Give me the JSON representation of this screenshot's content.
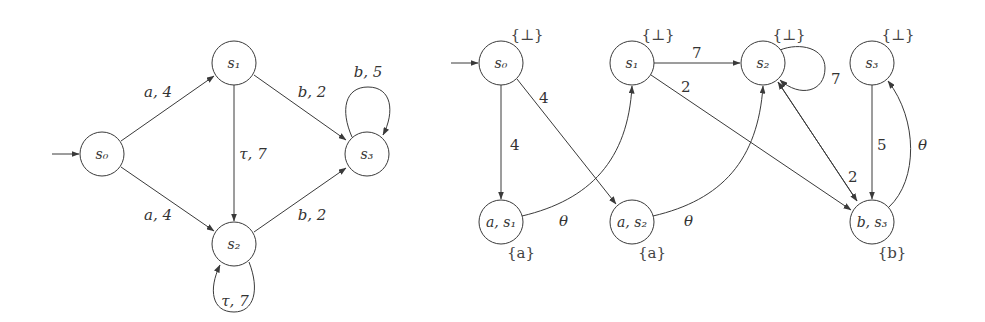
{
  "left_graph": {
    "initial_state": "s0",
    "nodes": [
      {
        "id": "s0",
        "label": "s₀"
      },
      {
        "id": "s1",
        "label": "s₁"
      },
      {
        "id": "s2",
        "label": "s₂"
      },
      {
        "id": "s3",
        "label": "s₃"
      }
    ],
    "edges": [
      {
        "from": "s0",
        "to": "s1",
        "label": "a, 4"
      },
      {
        "from": "s0",
        "to": "s2",
        "label": "a, 4"
      },
      {
        "from": "s1",
        "to": "s2",
        "label": "τ, 7"
      },
      {
        "from": "s1",
        "to": "s3",
        "label": "b, 2"
      },
      {
        "from": "s2",
        "to": "s3",
        "label": "b, 2"
      },
      {
        "from": "s3",
        "to": "s3",
        "label": "b, 5"
      },
      {
        "from": "s2",
        "to": "s2",
        "label": "τ, 7"
      }
    ]
  },
  "right_graph": {
    "initial_state": "s0",
    "nodes": [
      {
        "id": "s0",
        "label": "s₀",
        "annotation": "{⊥}"
      },
      {
        "id": "s1",
        "label": "s₁",
        "annotation": "{⊥}"
      },
      {
        "id": "s2",
        "label": "s₂",
        "annotation": "{⊥}"
      },
      {
        "id": "s3",
        "label": "s₃",
        "annotation": "{⊥}"
      },
      {
        "id": "as1",
        "label": "a, s₁",
        "annotation": "{a}"
      },
      {
        "id": "as2",
        "label": "a, s₂",
        "annotation": "{a}"
      },
      {
        "id": "bs3",
        "label": "b, s₃",
        "annotation": "{b}"
      }
    ],
    "edges": [
      {
        "from": "s0",
        "to": "as1",
        "label": "4"
      },
      {
        "from": "s0",
        "to": "as2",
        "label": "4"
      },
      {
        "from": "s1",
        "to": "s2",
        "label": "7"
      },
      {
        "from": "s1",
        "to": "bs3",
        "label": "2"
      },
      {
        "from": "s2",
        "to": "s2",
        "label": "7"
      },
      {
        "from": "s2",
        "to": "bs3",
        "label": "2"
      },
      {
        "from": "s3",
        "to": "bs3",
        "label": "5"
      },
      {
        "from": "as1",
        "to": "s1",
        "label": "θ"
      },
      {
        "from": "as2",
        "to": "s2",
        "label": "θ"
      },
      {
        "from": "bs3",
        "to": "s3",
        "label": "θ"
      }
    ]
  }
}
